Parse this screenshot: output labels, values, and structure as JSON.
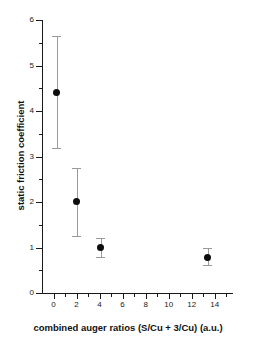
{
  "chart_data": {
    "type": "scatter",
    "title": "",
    "xlabel": "combined auger ratios (S/Cu + 3/Cu) (a.u.)",
    "ylabel": "static friction coefficient",
    "xlim": [
      -1.0,
      15.5
    ],
    "ylim": [
      0,
      6
    ],
    "grid": false,
    "legend": null,
    "xticks": [
      0,
      2,
      4,
      6,
      8,
      10,
      12,
      14
    ],
    "xtick_labels": [
      "0",
      "2",
      "4",
      "6",
      "8",
      "10",
      "12",
      "14"
    ],
    "x_minor_ticks": [
      1,
      3,
      5,
      7,
      9,
      11,
      13,
      15
    ],
    "yticks": [
      0,
      1,
      2,
      3,
      4,
      5,
      6
    ],
    "ytick_labels": [
      "0",
      "1",
      "2",
      "3",
      "4",
      "5",
      "6"
    ],
    "y_minor_ticks": [
      0.5,
      1.5,
      2.5,
      3.5,
      4.5,
      5.5
    ],
    "marker_color": "#0d0d0d",
    "errorbar_color": "#9a9a9a",
    "points": [
      {
        "x": 0.3,
        "y": 4.4,
        "yerr_low": 1.22,
        "yerr_high": 1.25
      },
      {
        "x": 2.0,
        "y": 2.01,
        "yerr_low": 0.76,
        "yerr_high": 0.73
      },
      {
        "x": 4.1,
        "y": 0.99,
        "yerr_low": 0.2,
        "yerr_high": 0.21
      },
      {
        "x": 13.4,
        "y": 0.79,
        "yerr_low": 0.18,
        "yerr_high": 0.19
      }
    ]
  }
}
